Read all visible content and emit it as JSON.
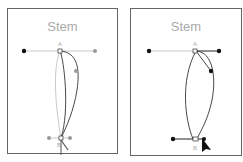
{
  "panels": [
    {
      "title": "Stem",
      "anchor_top": "A",
      "anchor_bottom": "B",
      "state": "before"
    },
    {
      "title": "Stem",
      "anchor_top": "A",
      "anchor_bottom": "B",
      "state": "after"
    }
  ],
  "colors": {
    "border": "#666666",
    "title": "#aaaaaa",
    "handle_active": "#111111",
    "handle_inactive": "#999999"
  }
}
